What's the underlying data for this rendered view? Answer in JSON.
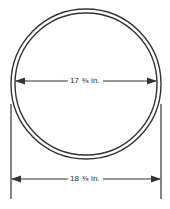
{
  "drawing": {
    "type": "engineering-dimension-diagram",
    "subject": "circular-ring-cross-section",
    "background_color": "#ffffff",
    "line_color": "#333333",
    "text_color": "#2b2b2b",
    "circle": {
      "outer": {
        "cx": 86,
        "cy": 84,
        "r": 75
      },
      "inner": {
        "cx": 86,
        "cy": 84,
        "r": 71
      }
    },
    "dimensions": [
      {
        "name": "inner-diameter",
        "value": "17",
        "fraction": "⅜",
        "unit": "in.",
        "label": "17 ⅜ in.",
        "y": 81,
        "x_start": 15,
        "x_end": 157
      },
      {
        "name": "outer-diameter",
        "value": "18",
        "fraction": "⅜",
        "unit": "in.",
        "label": "18 ⅜ in.",
        "y": 179,
        "x_start": 11,
        "x_end": 161
      }
    ],
    "extension_lines": [
      {
        "name": "left-extension-line",
        "x": 11,
        "y_top": 104,
        "y_bottom": 199
      },
      {
        "name": "right-extension-line",
        "x": 161,
        "y_top": 104,
        "y_bottom": 199
      }
    ]
  }
}
